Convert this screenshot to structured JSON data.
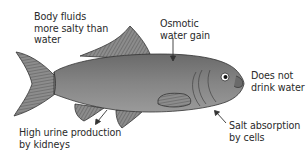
{
  "diagram": {
    "colors": {
      "body": "#7b7b7b",
      "body_dark": "#5f5f5f",
      "fin": "#8a8a8a",
      "fin_stripe": "#4a4a4a",
      "outline": "#333333",
      "text": "#2a2a2a",
      "arrow": "#333333"
    },
    "labels": {
      "body_fluids": "Body fluids\nmore salty than\nwater",
      "osmotic": "Osmotic\nwater gain",
      "drink": "Does not\ndrink water",
      "urine": "High urine production\nby kidneys",
      "salt": "Salt absorption\nby cells"
    }
  }
}
